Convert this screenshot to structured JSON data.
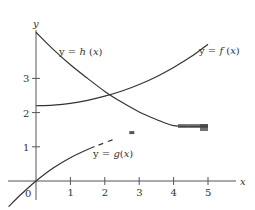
{
  "chart_data": {
    "type": "line",
    "title": "",
    "xlabel": "x",
    "ylabel": "y",
    "xlim": [
      -0.9,
      6.0
    ],
    "ylim": [
      -0.6,
      4.5
    ],
    "grid": false,
    "legend": "inline curve labels",
    "x_ticks": [
      "1",
      "2",
      "3",
      "4",
      "5"
    ],
    "y_ticks": [
      "1",
      "2",
      "3"
    ],
    "origin_label": "0",
    "series": [
      {
        "name": "y = f(x)",
        "label_parts": [
          "y = ",
          "f",
          " (",
          "x",
          ")"
        ],
        "x": [
          0,
          0.5,
          1,
          1.5,
          2,
          2.5,
          3,
          3.5,
          4,
          4.5,
          5
        ],
        "values": [
          2.2,
          2.22,
          2.27,
          2.36,
          2.48,
          2.63,
          2.82,
          3.05,
          3.32,
          3.63,
          4.0
        ]
      },
      {
        "name": "y = h(x)",
        "label_parts": [
          "y = ",
          "h",
          " (",
          "x",
          ")"
        ],
        "x": [
          0,
          0.5,
          1,
          1.5,
          2,
          2.5,
          3,
          3.5,
          4,
          4.5,
          5
        ],
        "values": [
          4.35,
          3.85,
          3.4,
          3.0,
          2.62,
          2.3,
          2.02,
          1.8,
          1.62,
          1.6,
          1.6
        ]
      },
      {
        "name": "y = g(x)",
        "label_parts": [
          "y = ",
          "g",
          "(",
          "x",
          ")"
        ],
        "x": [
          -0.8,
          -0.4,
          0,
          0.5,
          1,
          1.5,
          2,
          2.5,
          3
        ],
        "values": [
          -0.75,
          -0.36,
          0,
          0.38,
          0.68,
          0.92,
          1.12,
          1.3,
          1.45
        ],
        "style": "solid to x=1.7, dashed beyond"
      }
    ]
  }
}
